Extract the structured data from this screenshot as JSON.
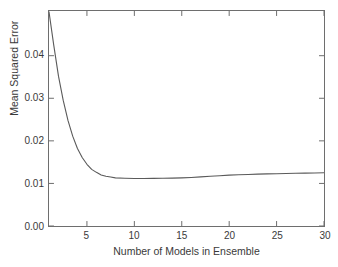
{
  "chart_data": {
    "type": "line",
    "title": "",
    "xlabel": "Number of Models in Ensemble",
    "ylabel": "Mean Squared Error",
    "xlim": [
      1,
      30
    ],
    "ylim": [
      0.0,
      0.0505
    ],
    "xticks": [
      5,
      10,
      15,
      20,
      25,
      30
    ],
    "xtick_labels": [
      "5",
      "10",
      "15",
      "20",
      "25",
      "30"
    ],
    "yticks": [
      0.0,
      0.01,
      0.02,
      0.03,
      0.04
    ],
    "ytick_labels": [
      "0.00",
      "0.01",
      "0.02",
      "0.03",
      "0.04"
    ],
    "grid": false,
    "legend": null,
    "line_color": "#5a5a5a",
    "frame_color": "#6e6e6e",
    "background_color": "#ffffff",
    "series": [
      {
        "name": "Mean Squared Error",
        "x": [
          1,
          1.5,
          2,
          2.5,
          3,
          3.5,
          4,
          4.5,
          5,
          5.5,
          6,
          6.5,
          7,
          7.5,
          8,
          9,
          10,
          11,
          12,
          13,
          14,
          15,
          16,
          17,
          18,
          19,
          20,
          21,
          22,
          23,
          24,
          25,
          26,
          27,
          28,
          29,
          30
        ],
        "y": [
          0.0503,
          0.0425,
          0.0352,
          0.0295,
          0.0248,
          0.0211,
          0.0182,
          0.0161,
          0.0145,
          0.0133,
          0.0126,
          0.012,
          0.0117,
          0.0115,
          0.0113,
          0.0112,
          0.01115,
          0.01115,
          0.01118,
          0.0112,
          0.01124,
          0.0113,
          0.0114,
          0.01153,
          0.01168,
          0.01182,
          0.01194,
          0.01203,
          0.01211,
          0.01218,
          0.01224,
          0.01229,
          0.01234,
          0.01238,
          0.01242,
          0.01246,
          0.0125
        ]
      }
    ]
  }
}
